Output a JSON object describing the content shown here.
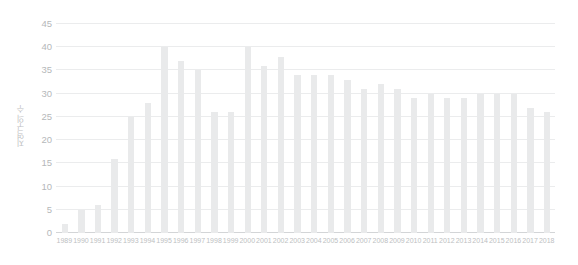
{
  "chart_data": {
    "type": "bar",
    "title": "",
    "subtitle": "",
    "xlabel": "",
    "ylabel": "지역구의 수",
    "categories": [
      "1989",
      "1990",
      "1991",
      "1992",
      "1993",
      "1994",
      "1995",
      "1996",
      "1997",
      "1998",
      "1999",
      "2000",
      "2001",
      "2002",
      "2003",
      "2004",
      "2005",
      "2006",
      "2007",
      "2008",
      "2009",
      "2010",
      "2011",
      "2012",
      "2013",
      "2014",
      "2015",
      "2016",
      "2017",
      "2018"
    ],
    "values": [
      2,
      5,
      6,
      16,
      25,
      28,
      40,
      37,
      35,
      26,
      26,
      40,
      36,
      38,
      34,
      34,
      34,
      33,
      31,
      32,
      31,
      29,
      30,
      29,
      29,
      30,
      30,
      30,
      27,
      26
    ],
    "ylim": [
      0,
      45
    ],
    "y_ticks": [
      0,
      5,
      10,
      15,
      20,
      25,
      30,
      35,
      40,
      45
    ],
    "y_tick_labels": [
      "0",
      "5",
      "10",
      "15",
      "20",
      "25",
      "30",
      "35",
      "40",
      "45"
    ],
    "grid": true,
    "legend": null,
    "legend_position": "none",
    "series": [
      {
        "name": "지역구의 수",
        "values": [
          2,
          5,
          6,
          16,
          25,
          28,
          40,
          37,
          35,
          26,
          26,
          40,
          36,
          38,
          34,
          34,
          34,
          33,
          31,
          32,
          31,
          29,
          30,
          29,
          29,
          30,
          30,
          30,
          27,
          26
        ]
      }
    ],
    "colors": {
      "bar": "#e9eaeb",
      "gridline": "#ebeced",
      "axis_line": "#d3d5d7",
      "tick_text": "#b5b8ba",
      "background": "#ffffff"
    }
  }
}
